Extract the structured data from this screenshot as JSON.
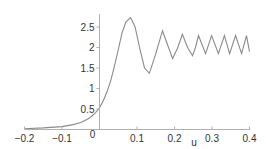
{
  "chart_data": {
    "type": "line",
    "title": "",
    "xlabel": "u",
    "ylabel": "",
    "xlim": [
      -0.2,
      0.4
    ],
    "ylim": [
      0,
      2.85
    ],
    "grid": false,
    "legend": null,
    "x_ticks": [
      "-0.2",
      "-0.1",
      "0",
      "0.1",
      "0.2",
      "0.3",
      "0.4"
    ],
    "y_ticks": [
      "0",
      "0.5",
      "1",
      "1.5",
      "2",
      "2.5"
    ],
    "series": [
      {
        "name": "curve",
        "color": "#8a8a8a",
        "x": [
          -0.2,
          -0.15,
          -0.1,
          -0.07,
          -0.05,
          -0.03,
          -0.02,
          -0.01,
          0.0,
          0.01,
          0.02,
          0.03,
          0.04,
          0.05,
          0.06,
          0.07,
          0.083,
          0.095,
          0.108,
          0.12,
          0.133,
          0.15,
          0.168,
          0.182,
          0.195,
          0.208,
          0.221,
          0.235,
          0.248,
          0.256,
          0.264,
          0.283,
          0.299,
          0.317,
          0.333,
          0.347,
          0.363,
          0.379,
          0.392,
          0.4
        ],
        "y": [
          0.02,
          0.04,
          0.07,
          0.12,
          0.17,
          0.26,
          0.33,
          0.42,
          0.53,
          0.7,
          0.92,
          1.2,
          1.55,
          1.95,
          2.35,
          2.62,
          2.73,
          2.5,
          1.95,
          1.5,
          1.37,
          1.85,
          2.41,
          2.05,
          1.73,
          1.98,
          2.32,
          2.0,
          1.8,
          2.0,
          2.29,
          1.85,
          2.29,
          1.85,
          2.29,
          1.85,
          2.29,
          1.85,
          2.29,
          1.9
        ]
      }
    ]
  }
}
